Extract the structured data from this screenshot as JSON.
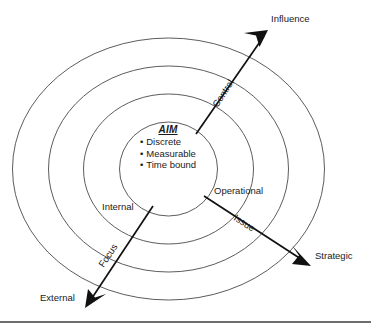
{
  "diagram": {
    "title_core": "AIM",
    "core_bullets": [
      "Discrete",
      "Measurable",
      "Time bound"
    ],
    "axes": [
      {
        "id": "control",
        "axis_label": "Control",
        "end_label": "Influence",
        "direction": "up-right"
      },
      {
        "id": "issue",
        "axis_label": "Issue",
        "end_label": "Strategic",
        "direction": "down-right"
      },
      {
        "id": "focus",
        "axis_label": "Focus",
        "end_label": "External",
        "direction": "down-left"
      }
    ],
    "ring_labels": [
      {
        "id": "internal",
        "text": "Internal"
      },
      {
        "id": "operational",
        "text": "Operational"
      }
    ],
    "ring_count": 4,
    "colors": {
      "ring_stroke": "#4a4a4a",
      "arrow": "#111111",
      "text": "#1a1a1a",
      "rule": "#3c3c3c",
      "background": "#ffffff"
    }
  }
}
